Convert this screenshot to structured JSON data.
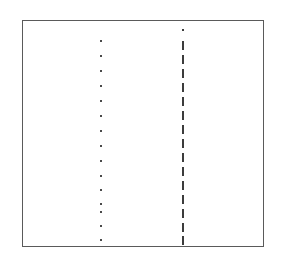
{
  "figure": {
    "title": "",
    "background_color": "#ffffff",
    "width": 281,
    "height": 262
  },
  "frame": {
    "name": "plot-border",
    "x": 22,
    "y": 20,
    "width": 242,
    "height": 227,
    "border_color": "#5a5a5a",
    "border_width": 1,
    "fill": "none"
  },
  "chart_data": {
    "type": "scatter",
    "title": "",
    "subtitle": "",
    "xlabel": "",
    "ylabel": "",
    "xlim": [
      22,
      264
    ],
    "ylim": [
      20,
      247
    ],
    "grid": false,
    "legend": null,
    "axis_ticks": false,
    "axis_labels": false,
    "annotations": [],
    "series": [
      {
        "name": "dotted-column",
        "marker": "square-dot",
        "color": "#4a4a4a",
        "marker_size": 2,
        "x": 101,
        "y_values": [
          41,
          56,
          71,
          86,
          101,
          116,
          131,
          146,
          161,
          176,
          190,
          204,
          212,
          226,
          240
        ],
        "count": 15
      },
      {
        "name": "dashed-line-column",
        "marker": "vertical-dash",
        "color": "#3c3c3c",
        "dash_width": 2,
        "dash_height": 9,
        "dash_gap": 5,
        "x": 183,
        "y_values": [
          29,
          41,
          55,
          69,
          83,
          97,
          111,
          125,
          139,
          153,
          167,
          181,
          195,
          209,
          223,
          236
        ],
        "count": 16
      }
    ]
  }
}
